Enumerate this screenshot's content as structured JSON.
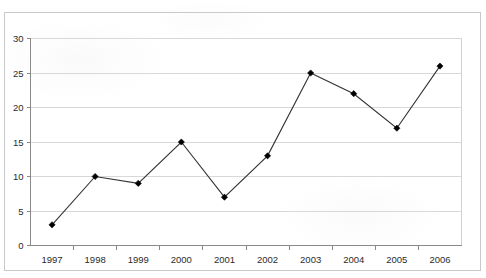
{
  "chart_data": {
    "type": "line",
    "title": "",
    "subtitle": "",
    "xlabel": "",
    "ylabel": "",
    "categories": [
      "1997",
      "1998",
      "1999",
      "2000",
      "2001",
      "2002",
      "2003",
      "2004",
      "2005",
      "2006"
    ],
    "values": [
      3,
      10,
      9,
      15,
      7,
      13,
      25,
      22,
      17,
      26
    ],
    "series": [
      {
        "name": "",
        "values": [
          3,
          10,
          9,
          15,
          7,
          13,
          25,
          22,
          17,
          26
        ]
      }
    ],
    "ylim": [
      0,
      30
    ],
    "ytick_labels": [
      "0",
      "5",
      "10",
      "15",
      "20",
      "25",
      "30"
    ],
    "ytick_values": [
      0,
      5,
      10,
      15,
      20,
      25,
      30
    ],
    "xtick_labels": [
      "1997",
      "1998",
      "1999",
      "2000",
      "2001",
      "2002",
      "2003",
      "2004",
      "2005",
      "2006"
    ],
    "grid": true,
    "grid_axis": "y",
    "legend": false,
    "legend_position": "none",
    "marker": "diamond",
    "annotations": []
  },
  "style": {
    "line_color": "#333333",
    "marker_color": "#000000",
    "grid_color": "#d8d8d8",
    "axis_color": "#8a8a8a",
    "frame_color": "#c9c9c9",
    "background": "#ffffff",
    "text_color": "#2b2b2b"
  }
}
